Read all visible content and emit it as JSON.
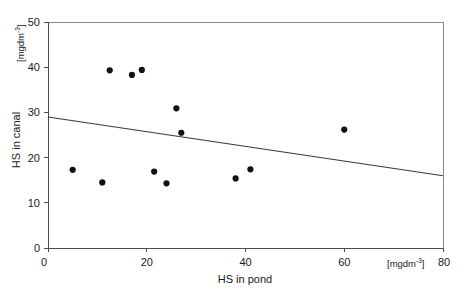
{
  "figure": {
    "background_color": "#ffffff",
    "point_color": "#111111",
    "line_color": "#3a3a3a",
    "axis_color": "#4d4d4d"
  },
  "axes": {
    "x": {
      "title": "HS in pond",
      "unit_base": "[mgdm",
      "unit_exp": "-3",
      "unit_close": "]",
      "ticks": [
        "0",
        "20",
        "40",
        "60",
        "80"
      ],
      "origin_label": "0"
    },
    "y": {
      "title": "HS in canal",
      "unit_base": "[mgdm",
      "unit_exp": "-3",
      "unit_close": "]",
      "ticks": [
        "0",
        "10",
        "20",
        "30",
        "40",
        "50"
      ],
      "origin_label": "0"
    }
  },
  "chart_data": {
    "type": "scatter",
    "title": "",
    "subtitle": "",
    "xlabel": "HS in pond",
    "ylabel": "HS in canal",
    "xunit": "[mgdm-3]",
    "yunit": "[mgdm-3]",
    "xlim": [
      0,
      80
    ],
    "ylim": [
      0,
      50
    ],
    "xticks": [
      0,
      20,
      40,
      60,
      80
    ],
    "yticks": [
      0,
      10,
      20,
      30,
      40,
      50
    ],
    "grid": false,
    "legend": null,
    "series": [
      {
        "name": "HS measurements",
        "marker": "filled-circle",
        "x": [
          5.0,
          11.0,
          12.5,
          17.0,
          19.0,
          21.5,
          24.0,
          26.0,
          27.0,
          38.0,
          41.0,
          60.0
        ],
        "y": [
          17.3,
          14.5,
          39.3,
          38.3,
          39.4,
          16.9,
          14.3,
          30.9,
          25.5,
          15.4,
          17.4,
          26.2
        ]
      }
    ],
    "trendline": {
      "name": "linear regression",
      "x": [
        0,
        80
      ],
      "y": [
        29.0,
        16.0
      ],
      "slope": -0.1625,
      "intercept": 29.0
    }
  }
}
